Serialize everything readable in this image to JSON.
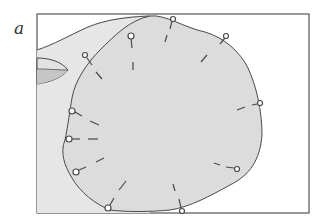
{
  "figure": {
    "panel_label": "a",
    "colors": {
      "frame": "#555555",
      "background_region": "#e6e6e6",
      "main_region": "#dedede",
      "outline": "#4a4a4a",
      "side_lobe_dark": "#c4c4c4",
      "pin_head": "#ffffff"
    },
    "frame": {
      "x": 37,
      "y": 14,
      "width": 272,
      "height": 199
    },
    "pin_count": 15,
    "pins": [
      {
        "head": [
          131,
          36
        ],
        "tick": [
          133,
          62,
          133,
          70
        ]
      },
      {
        "head": [
          173,
          19
        ],
        "tick": [
          165,
          42,
          168,
          35
        ]
      },
      {
        "head": [
          226,
          36
        ],
        "tick": [
          201,
          62,
          207,
          55
        ]
      },
      {
        "head": [
          260,
          103
        ],
        "tick": [
          237,
          109,
          245,
          106
        ]
      },
      {
        "head": [
          237,
          169
        ],
        "tick": [
          214,
          163,
          222,
          166
        ]
      },
      {
        "head": [
          182,
          211
        ],
        "tick": [
          173,
          184,
          175,
          192
        ]
      },
      {
        "head": [
          108,
          208
        ],
        "tick": [
          121,
          187,
          126,
          180
        ]
      },
      {
        "head": [
          76,
          172
        ],
        "tick": [
          95,
          162,
          104,
          158
        ]
      },
      {
        "head": [
          69,
          139
        ],
        "tick": [
          88,
          139,
          97,
          139
        ]
      },
      {
        "head": [
          72,
          111
        ],
        "tick": [
          88,
          121,
          97,
          125
        ]
      },
      {
        "head": [
          85,
          55
        ],
        "tick": [
          96,
          72,
          102,
          79
        ]
      }
    ]
  }
}
